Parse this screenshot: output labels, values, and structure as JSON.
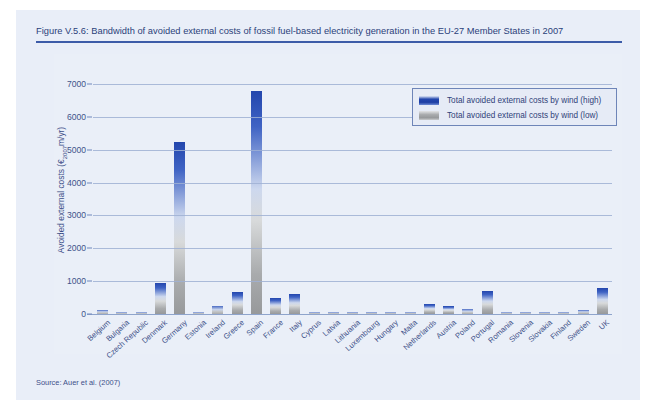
{
  "figure": {
    "title": "Figure V.5.6: Bandwidth of avoided external costs of fossil fuel-based electricity generation in the EU-27 Member States in 2007",
    "source": "Source: Auer et al. (2007)"
  },
  "legend": {
    "position": "top-right",
    "entries": [
      {
        "label": "Total avoided external costs by wind (high)",
        "color": "#2346ad",
        "swatch": "high"
      },
      {
        "label": "Total avoided external costs by wind (low)",
        "color": "#a9abad",
        "swatch": "low"
      }
    ]
  },
  "colors": {
    "panel_background": "#e9eef8",
    "title_text": "#2b3f7a",
    "title_rule": "#3c5ba8",
    "gridline": "#9fb0d4",
    "high_blue": "#2346ad",
    "low_gray": "#a9abad"
  },
  "chart_data": {
    "type": "bar",
    "title": "Bandwidth of avoided external costs of fossil fuel-based electricity generation in the EU-27 Member States in 2007",
    "xlabel": "",
    "ylabel": "Avoided external costs (€2007m/yr)",
    "ylim": [
      0,
      7400
    ],
    "yticks": [
      1000,
      2000,
      3000,
      4000,
      5000,
      6000,
      7000
    ],
    "ytick_labels": [
      "1000",
      "2000",
      "3000",
      "4000",
      "5000",
      "6000",
      "7000"
    ],
    "zero_label": "0",
    "grid": true,
    "categories": [
      "Belgium",
      "Bulgaria",
      "Czech Republic",
      "Denmark",
      "Germany",
      "Estonia",
      "Ireland",
      "Greece",
      "Spain",
      "France",
      "Italy",
      "Cyprus",
      "Latvia",
      "Lithuania",
      "Luxembourg",
      "Hungary",
      "Malta",
      "Netherlands",
      "Austria",
      "Poland",
      "Portugal",
      "Romania",
      "Slovenia",
      "Slovakia",
      "Finland",
      "Sweden",
      "UK"
    ],
    "series": [
      {
        "name": "Total avoided external costs by wind (high)",
        "color": "#2346ad",
        "values": [
          110,
          40,
          60,
          950,
          5250,
          20,
          230,
          660,
          6800,
          500,
          620,
          5,
          10,
          10,
          30,
          70,
          5,
          310,
          250,
          140,
          700,
          10,
          5,
          5,
          25,
          130,
          800
        ]
      },
      {
        "name": "Total avoided external costs by wind (low)",
        "color": "#a9abad",
        "values": [
          30,
          10,
          15,
          260,
          900,
          5,
          60,
          180,
          1320,
          130,
          170,
          1,
          3,
          3,
          8,
          18,
          1,
          85,
          65,
          35,
          190,
          3,
          1,
          1,
          6,
          35,
          215
        ]
      }
    ]
  }
}
